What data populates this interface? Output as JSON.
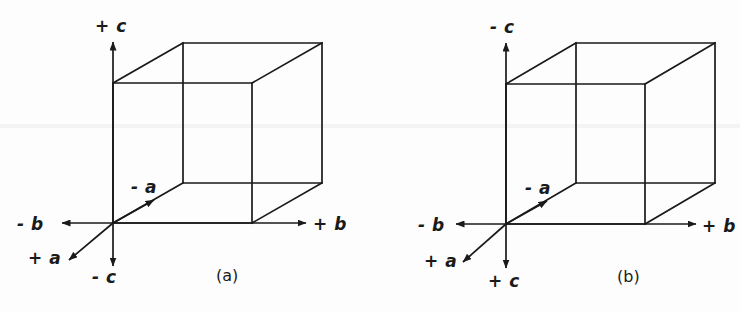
{
  "figure": {
    "background_color": "#fdfdfd",
    "line_color": "#1a1a1a",
    "panels": [
      {
        "id": "a",
        "caption": "(a)",
        "caption_x": 216,
        "caption_y": 268,
        "origin_x": 113,
        "origin_y": 223,
        "cube": {
          "front_left_x": 113,
          "front_top_y": 83,
          "front_right_x": 252,
          "front_bottom_y": 223,
          "depth_dx": 70,
          "depth_dy": -40
        },
        "axes": [
          {
            "name": "c-positive",
            "label": "+ c",
            "direction": "up",
            "label_x": 95,
            "label_y": 18,
            "tip_x": 113,
            "tip_y": 40,
            "tail_x": 113,
            "tail_y": 223
          },
          {
            "name": "c-negative",
            "label": "- c",
            "direction": "down",
            "label_x": 92,
            "label_y": 269,
            "tip_x": 113,
            "tip_y": 268,
            "tail_x": 113,
            "tail_y": 223
          },
          {
            "name": "b-negative",
            "label": "- b",
            "direction": "left",
            "label_x": 17,
            "label_y": 216,
            "tip_x": 60,
            "tip_y": 223,
            "tail_x": 113,
            "tail_y": 223
          },
          {
            "name": "b-positive",
            "label": "+ b",
            "direction": "right",
            "label_x": 313,
            "label_y": 216,
            "tip_x": 308,
            "tip_y": 223,
            "tail_x": 113,
            "tail_y": 223
          },
          {
            "name": "a-negative",
            "label": "- a",
            "direction": "up-right",
            "label_x": 131,
            "label_y": 179,
            "tip_x": 156,
            "tip_y": 198,
            "tail_x": 113,
            "tail_y": 223
          },
          {
            "name": "a-positive",
            "label": "+ a",
            "direction": "down-left",
            "label_x": 28,
            "label_y": 250,
            "tip_x": 67,
            "tip_y": 262,
            "tail_x": 113,
            "tail_y": 223
          }
        ]
      },
      {
        "id": "b",
        "caption": "(b)",
        "caption_x": 617,
        "caption_y": 269,
        "origin_x": 506,
        "origin_y": 224,
        "cube": {
          "front_left_x": 506,
          "front_top_y": 84,
          "front_right_x": 645,
          "front_bottom_y": 224,
          "depth_dx": 70,
          "depth_dy": -41
        },
        "axes": [
          {
            "name": "c-negative",
            "label": "- c",
            "direction": "up",
            "label_x": 490,
            "label_y": 19,
            "tip_x": 506,
            "tip_y": 41,
            "tail_x": 506,
            "tail_y": 224
          },
          {
            "name": "c-positive",
            "label": "+ c",
            "direction": "down",
            "label_x": 488,
            "label_y": 273,
            "tip_x": 506,
            "tip_y": 270,
            "tail_x": 506,
            "tail_y": 224
          },
          {
            "name": "b-negative",
            "label": "- b",
            "direction": "left",
            "label_x": 418,
            "label_y": 217,
            "tip_x": 454,
            "tip_y": 224,
            "tail_x": 506,
            "tail_y": 224
          },
          {
            "name": "b-positive",
            "label": "+ b",
            "direction": "right",
            "label_x": 702,
            "label_y": 218,
            "tip_x": 698,
            "tip_y": 224,
            "tail_x": 506,
            "tail_y": 224
          },
          {
            "name": "a-negative",
            "label": "- a",
            "direction": "up-right",
            "label_x": 525,
            "label_y": 180,
            "tip_x": 549,
            "tip_y": 199,
            "tail_x": 506,
            "tail_y": 224
          },
          {
            "name": "a-positive",
            "label": "+ a",
            "direction": "down-left",
            "label_x": 424,
            "label_y": 253,
            "tip_x": 461,
            "tip_y": 264,
            "tail_x": 506,
            "tail_y": 224
          }
        ]
      }
    ]
  }
}
